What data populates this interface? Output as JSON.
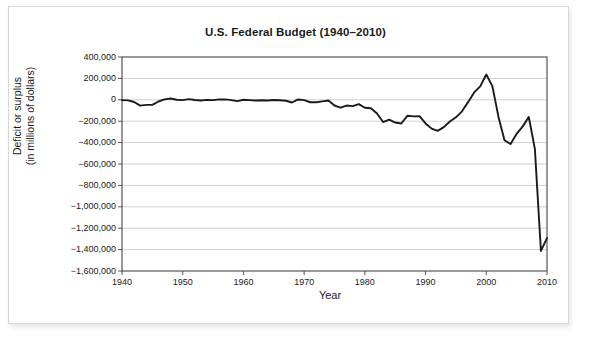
{
  "chart_data": {
    "type": "line",
    "title": "U.S. Federal Budget (1940–2010)",
    "xlabel": "Year",
    "ylabel_line1": "Deficit or surplus",
    "ylabel_line2": "(in millions of dollars)",
    "xlim": [
      1940,
      2010
    ],
    "ylim": [
      -1600000,
      400000
    ],
    "xticks": [
      1940,
      1950,
      1960,
      1970,
      1980,
      1990,
      2000,
      2010
    ],
    "yticks": [
      400000,
      200000,
      0,
      -200000,
      -400000,
      -600000,
      -800000,
      -1000000,
      -1200000,
      -1400000,
      -1600000
    ],
    "ytick_labels": [
      "400,000",
      "200,000",
      "0",
      "−200,000",
      "−400,000",
      "−600,000",
      "−800,000",
      "−1,000,000",
      "−1,200,000",
      "−1,400,000",
      "−1,600,000"
    ],
    "xtick_labels": [
      "1940",
      "1950",
      "1960",
      "1970",
      "1980",
      "1990",
      "2000",
      "2010"
    ],
    "grid": "horizontal",
    "legend": "none",
    "line_color": "#1a1a1a",
    "grid_color": "#d0d0d0",
    "axis_color": "#555555",
    "series": [
      {
        "name": "Deficit or surplus",
        "x": [
          1940,
          1941,
          1942,
          1943,
          1944,
          1945,
          1946,
          1947,
          1948,
          1949,
          1950,
          1951,
          1952,
          1953,
          1954,
          1955,
          1956,
          1957,
          1958,
          1959,
          1960,
          1961,
          1962,
          1963,
          1964,
          1965,
          1966,
          1967,
          1968,
          1969,
          1970,
          1971,
          1972,
          1973,
          1974,
          1975,
          1976,
          1977,
          1978,
          1979,
          1980,
          1981,
          1982,
          1983,
          1984,
          1985,
          1986,
          1987,
          1988,
          1989,
          1990,
          1991,
          1992,
          1993,
          1994,
          1995,
          1996,
          1997,
          1998,
          1999,
          2000,
          2001,
          2002,
          2003,
          2004,
          2005,
          2006,
          2007,
          2008,
          2009,
          2010
        ],
        "values": [
          -2920,
          -4941,
          -20503,
          -54554,
          -47557,
          -47553,
          -15936,
          4018,
          11796,
          580,
          -3119,
          6102,
          -1519,
          -6493,
          -1154,
          -2993,
          3947,
          3412,
          -2769,
          -12849,
          301,
          -3335,
          -7146,
          -4756,
          -5915,
          -1411,
          -3698,
          -8643,
          -25161,
          3242,
          -2842,
          -23033,
          -23373,
          -14908,
          -6135,
          -53242,
          -73732,
          -53659,
          -59186,
          -40726,
          -73830,
          -78968,
          -127977,
          -207802,
          -185367,
          -212308,
          -221227,
          -149730,
          -155178,
          -152639,
          -221036,
          -269238,
          -290321,
          -255051,
          -203186,
          -163952,
          -107431,
          -21884,
          69270,
          125610,
          236241,
          128236,
          -157758,
          -377585,
          -412727,
          -318346,
          -248181,
          -160701,
          -458553,
          -1412688,
          -1293489
        ]
      }
    ]
  }
}
